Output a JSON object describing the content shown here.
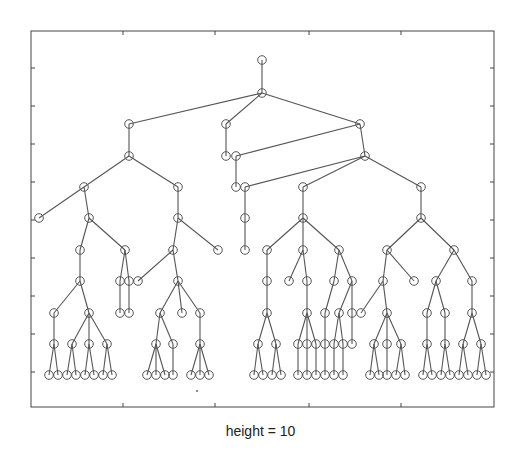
{
  "caption": "height = 10",
  "style": {
    "edge_color": "#555555",
    "node_color": "#555555",
    "frame_color": "#444444",
    "background": "#ffffff",
    "node_radius": 4.3
  },
  "axes": {
    "left": 31,
    "right": 494,
    "top": 31,
    "bottom": 407,
    "xticks": [
      123,
      215,
      309,
      401
    ],
    "yticks": [
      68,
      106,
      144,
      182,
      220,
      258,
      296,
      334,
      372
    ]
  },
  "chart_data": {
    "type": "tree",
    "title": "",
    "xlabel": "height = 10",
    "ylabel": "",
    "height": 10,
    "levels_y": [
      60,
      93,
      124,
      156,
      187,
      218,
      250,
      281,
      313,
      344,
      375
    ],
    "nodes": [
      {
        "id": 0,
        "x": 262,
        "lvl": 0,
        "p": -1
      },
      {
        "id": 1,
        "x": 262,
        "lvl": 1,
        "p": 0
      },
      {
        "id": 2,
        "x": 129,
        "lvl": 2,
        "p": 1
      },
      {
        "id": 3,
        "x": 226,
        "lvl": 2,
        "p": 1
      },
      {
        "id": 4,
        "x": 360,
        "lvl": 2,
        "p": 1
      },
      {
        "id": 5,
        "x": 129,
        "lvl": 3,
        "p": 2
      },
      {
        "id": 6,
        "x": 226,
        "lvl": 3,
        "p": 3
      },
      {
        "id": 7,
        "x": 236,
        "lvl": 3,
        "p": 4
      },
      {
        "id": 8,
        "x": 365,
        "lvl": 3,
        "p": 4
      },
      {
        "id": 9,
        "x": 84,
        "lvl": 4,
        "p": 5
      },
      {
        "id": 10,
        "x": 178,
        "lvl": 4,
        "p": 5
      },
      {
        "id": 11,
        "x": 236,
        "lvl": 4,
        "p": 7
      },
      {
        "id": 12,
        "x": 245,
        "lvl": 4,
        "p": 8
      },
      {
        "id": 13,
        "x": 303,
        "lvl": 4,
        "p": 8
      },
      {
        "id": 14,
        "x": 421,
        "lvl": 4,
        "p": 8
      },
      {
        "id": 15,
        "x": 39,
        "lvl": 5,
        "p": 9
      },
      {
        "id": 16,
        "x": 89,
        "lvl": 5,
        "p": 9
      },
      {
        "id": 17,
        "x": 178,
        "lvl": 5,
        "p": 10
      },
      {
        "id": 18,
        "x": 245,
        "lvl": 5,
        "p": 12
      },
      {
        "id": 19,
        "x": 303,
        "lvl": 5,
        "p": 13
      },
      {
        "id": 20,
        "x": 421,
        "lvl": 5,
        "p": 14
      },
      {
        "id": 21,
        "x": 80,
        "lvl": 6,
        "p": 16
      },
      {
        "id": 22,
        "x": 125,
        "lvl": 6,
        "p": 16
      },
      {
        "id": 23,
        "x": 173,
        "lvl": 6,
        "p": 17
      },
      {
        "id": 24,
        "x": 218,
        "lvl": 6,
        "p": 17
      },
      {
        "id": 25,
        "x": 245,
        "lvl": 6,
        "p": 18
      },
      {
        "id": 26,
        "x": 267,
        "lvl": 6,
        "p": 19
      },
      {
        "id": 27,
        "x": 303,
        "lvl": 6,
        "p": 19
      },
      {
        "id": 28,
        "x": 339,
        "lvl": 6,
        "p": 19
      },
      {
        "id": 29,
        "x": 387,
        "lvl": 6,
        "p": 20
      },
      {
        "id": 30,
        "x": 454,
        "lvl": 6,
        "p": 20
      },
      {
        "id": 31,
        "x": 80,
        "lvl": 7,
        "p": 21
      },
      {
        "id": 32,
        "x": 120,
        "lvl": 7,
        "p": 22
      },
      {
        "id": 33,
        "x": 129,
        "lvl": 7,
        "p": 22
      },
      {
        "id": 34,
        "x": 138,
        "lvl": 7,
        "p": 23
      },
      {
        "id": 35,
        "x": 178,
        "lvl": 7,
        "p": 23
      },
      {
        "id": 36,
        "x": 267,
        "lvl": 7,
        "p": 26
      },
      {
        "id": 37,
        "x": 289,
        "lvl": 7,
        "p": 27
      },
      {
        "id": 38,
        "x": 307,
        "lvl": 7,
        "p": 27
      },
      {
        "id": 39,
        "x": 334,
        "lvl": 7,
        "p": 28
      },
      {
        "id": 40,
        "x": 352,
        "lvl": 7,
        "p": 28
      },
      {
        "id": 41,
        "x": 383,
        "lvl": 7,
        "p": 29
      },
      {
        "id": 42,
        "x": 414,
        "lvl": 7,
        "p": 29
      },
      {
        "id": 43,
        "x": 436,
        "lvl": 7,
        "p": 30
      },
      {
        "id": 44,
        "x": 472,
        "lvl": 7,
        "p": 30
      },
      {
        "id": 45,
        "x": 54,
        "lvl": 8,
        "p": 31
      },
      {
        "id": 46,
        "x": 89,
        "lvl": 8,
        "p": 31
      },
      {
        "id": 47,
        "x": 120,
        "lvl": 8,
        "p": 32
      },
      {
        "id": 48,
        "x": 129,
        "lvl": 8,
        "p": 33
      },
      {
        "id": 49,
        "x": 160,
        "lvl": 8,
        "p": 35
      },
      {
        "id": 50,
        "x": 182,
        "lvl": 8,
        "p": 35
      },
      {
        "id": 51,
        "x": 200,
        "lvl": 8,
        "p": 35
      },
      {
        "id": 52,
        "x": 267,
        "lvl": 8,
        "p": 36
      },
      {
        "id": 53,
        "x": 307,
        "lvl": 8,
        "p": 38
      },
      {
        "id": 54,
        "x": 325,
        "lvl": 8,
        "p": 39
      },
      {
        "id": 55,
        "x": 339,
        "lvl": 8,
        "p": 40
      },
      {
        "id": 56,
        "x": 352,
        "lvl": 8,
        "p": 40
      },
      {
        "id": 57,
        "x": 361,
        "lvl": 8,
        "p": 41
      },
      {
        "id": 58,
        "x": 387,
        "lvl": 8,
        "p": 41
      },
      {
        "id": 59,
        "x": 427,
        "lvl": 8,
        "p": 43
      },
      {
        "id": 60,
        "x": 445,
        "lvl": 8,
        "p": 43
      },
      {
        "id": 61,
        "x": 472,
        "lvl": 8,
        "p": 44
      },
      {
        "id": 62,
        "x": 54,
        "lvl": 9,
        "p": 45
      },
      {
        "id": 63,
        "x": 72,
        "lvl": 9,
        "p": 46
      },
      {
        "id": 64,
        "x": 89,
        "lvl": 9,
        "p": 46
      },
      {
        "id": 65,
        "x": 107,
        "lvl": 9,
        "p": 46
      },
      {
        "id": 66,
        "x": 156,
        "lvl": 9,
        "p": 49
      },
      {
        "id": 67,
        "x": 173,
        "lvl": 9,
        "p": 49
      },
      {
        "id": 68,
        "x": 200,
        "lvl": 9,
        "p": 51
      },
      {
        "id": 69,
        "x": 258,
        "lvl": 9,
        "p": 52
      },
      {
        "id": 70,
        "x": 276,
        "lvl": 9,
        "p": 52
      },
      {
        "id": 71,
        "x": 298,
        "lvl": 9,
        "p": 53
      },
      {
        "id": 72,
        "x": 307,
        "lvl": 9,
        "p": 53
      },
      {
        "id": 73,
        "x": 316,
        "lvl": 9,
        "p": 53
      },
      {
        "id": 74,
        "x": 325,
        "lvl": 9,
        "p": 54
      },
      {
        "id": 75,
        "x": 334,
        "lvl": 9,
        "p": 55
      },
      {
        "id": 76,
        "x": 343,
        "lvl": 9,
        "p": 55
      },
      {
        "id": 77,
        "x": 352,
        "lvl": 9,
        "p": 56
      },
      {
        "id": 78,
        "x": 374,
        "lvl": 9,
        "p": 58
      },
      {
        "id": 79,
        "x": 387,
        "lvl": 9,
        "p": 58
      },
      {
        "id": 80,
        "x": 401,
        "lvl": 9,
        "p": 58
      },
      {
        "id": 81,
        "x": 427,
        "lvl": 9,
        "p": 59
      },
      {
        "id": 82,
        "x": 445,
        "lvl": 9,
        "p": 60
      },
      {
        "id": 83,
        "x": 463,
        "lvl": 9,
        "p": 61
      },
      {
        "id": 84,
        "x": 481,
        "lvl": 9,
        "p": 61
      },
      {
        "id": 85,
        "x": 49,
        "lvl": 10,
        "p": 62
      },
      {
        "id": 86,
        "x": 58,
        "lvl": 10,
        "p": 62
      },
      {
        "id": 87,
        "x": 67,
        "lvl": 10,
        "p": 63
      },
      {
        "id": 88,
        "x": 76,
        "lvl": 10,
        "p": 63
      },
      {
        "id": 89,
        "x": 85,
        "lvl": 10,
        "p": 64
      },
      {
        "id": 90,
        "x": 94,
        "lvl": 10,
        "p": 64
      },
      {
        "id": 91,
        "x": 103,
        "lvl": 10,
        "p": 65
      },
      {
        "id": 92,
        "x": 112,
        "lvl": 10,
        "p": 65
      },
      {
        "id": 93,
        "x": 147,
        "lvl": 10,
        "p": 66
      },
      {
        "id": 94,
        "x": 156,
        "lvl": 10,
        "p": 66
      },
      {
        "id": 95,
        "x": 165,
        "lvl": 10,
        "p": 66
      },
      {
        "id": 96,
        "x": 173,
        "lvl": 10,
        "p": 67
      },
      {
        "id": 97,
        "x": 191,
        "lvl": 10,
        "p": 68
      },
      {
        "id": 98,
        "x": 200,
        "lvl": 10,
        "p": 68
      },
      {
        "id": 99,
        "x": 209,
        "lvl": 10,
        "p": 68
      },
      {
        "id": 100,
        "x": 254,
        "lvl": 10,
        "p": 69
      },
      {
        "id": 101,
        "x": 263,
        "lvl": 10,
        "p": 69
      },
      {
        "id": 102,
        "x": 272,
        "lvl": 10,
        "p": 70
      },
      {
        "id": 103,
        "x": 281,
        "lvl": 10,
        "p": 70
      },
      {
        "id": 104,
        "x": 298,
        "lvl": 10,
        "p": 71
      },
      {
        "id": 105,
        "x": 307,
        "lvl": 10,
        "p": 72
      },
      {
        "id": 106,
        "x": 316,
        "lvl": 10,
        "p": 73
      },
      {
        "id": 107,
        "x": 325,
        "lvl": 10,
        "p": 74
      },
      {
        "id": 108,
        "x": 334,
        "lvl": 10,
        "p": 75
      },
      {
        "id": 109,
        "x": 343,
        "lvl": 10,
        "p": 76
      },
      {
        "id": 110,
        "x": 370,
        "lvl": 10,
        "p": 78
      },
      {
        "id": 111,
        "x": 379,
        "lvl": 10,
        "p": 78
      },
      {
        "id": 112,
        "x": 387,
        "lvl": 10,
        "p": 79
      },
      {
        "id": 113,
        "x": 396,
        "lvl": 10,
        "p": 80
      },
      {
        "id": 114,
        "x": 405,
        "lvl": 10,
        "p": 80
      },
      {
        "id": 115,
        "x": 423,
        "lvl": 10,
        "p": 81
      },
      {
        "id": 116,
        "x": 432,
        "lvl": 10,
        "p": 81
      },
      {
        "id": 117,
        "x": 441,
        "lvl": 10,
        "p": 82
      },
      {
        "id": 118,
        "x": 450,
        "lvl": 10,
        "p": 82
      },
      {
        "id": 119,
        "x": 459,
        "lvl": 10,
        "p": 83
      },
      {
        "id": 120,
        "x": 468,
        "lvl": 10,
        "p": 83
      },
      {
        "id": 121,
        "x": 477,
        "lvl": 10,
        "p": 84
      },
      {
        "id": 122,
        "x": 486,
        "lvl": 10,
        "p": 84
      }
    ],
    "stray_dot": {
      "x": 197,
      "y": 391
    }
  }
}
